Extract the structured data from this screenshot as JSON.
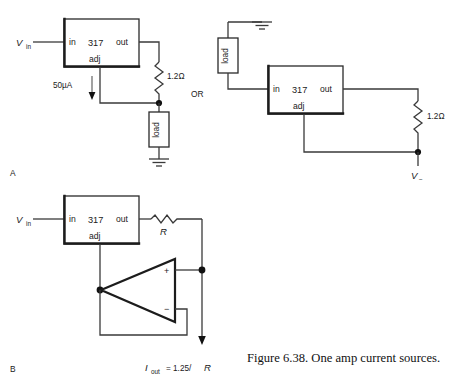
{
  "figure": {
    "caption": "Figure 6.38.  One amp current sources.",
    "panels": [
      {
        "id": "A",
        "label": "A"
      },
      {
        "id": "B",
        "label": "B"
      }
    ],
    "connector_label": "OR"
  },
  "circuit_a": {
    "source_label_main": "V",
    "source_label_sub": "in",
    "regulator": {
      "part": "317",
      "pin_in": "in",
      "pin_out": "out",
      "pin_adj": "adj"
    },
    "adj_current": "50µA",
    "resistor": "1.2Ω",
    "load": "load",
    "ground_icon": "ground-icon"
  },
  "circuit_a_alt": {
    "regulator": {
      "part": "317",
      "pin_in": "in",
      "pin_out": "out",
      "pin_adj": "adj"
    },
    "resistor": "1.2Ω",
    "load": "load",
    "rail_label_main": "V",
    "rail_label_sub": "−",
    "ground_icon": "ground-icon"
  },
  "circuit_b": {
    "source_label_main": "V",
    "source_label_sub": "in",
    "regulator": {
      "part": "317",
      "pin_in": "in",
      "pin_out": "out",
      "pin_adj": "adj"
    },
    "resistor": "R",
    "opamp": {
      "plus": "+",
      "minus": "−"
    },
    "output_main": "I",
    "output_sub": "out",
    "output_expr": "= 1.25/",
    "output_var": "R"
  },
  "colors": {
    "wire": "#3a3a3a",
    "outline": "#1c1c1c",
    "text": "#1a1a1a",
    "background": "#ffffff"
  }
}
